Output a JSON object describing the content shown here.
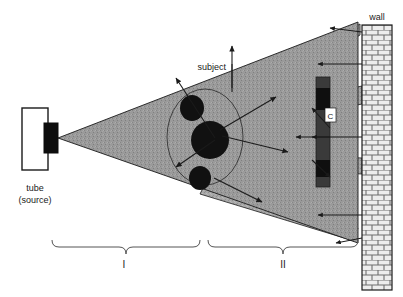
{
  "figure": {
    "title_visible": false,
    "background_color": "#ffffff"
  },
  "labels": {
    "tube_line1": "tube",
    "tube_line2": "(source)",
    "subject": "subject",
    "wall": "wall",
    "cassette": "C",
    "zone_one": "I",
    "zone_two": "II"
  },
  "colors": {
    "beam_fill": "#a8a8a8",
    "beam_stroke": "#1a1a1a",
    "subject_fill": "#9a9a9a",
    "organ_fill": "#111111",
    "tube_housing_fill": "#ffffff",
    "tube_port_fill": "#0d0d0d",
    "cassette_fill": "#3a3a3a",
    "wall_fill": "#e8e8e8",
    "wall_mortar": "#707070",
    "arrow_color": "#1a1a1a",
    "brace_color": "#555555",
    "outline": "#1a1a1a"
  },
  "components": {
    "tube": {
      "name": "x-ray-tube-housing",
      "x": 22,
      "y": 108,
      "width": 26,
      "height": 62
    },
    "tube_port": {
      "name": "x-ray-tube-port",
      "x": 44,
      "y": 123,
      "width": 14,
      "height": 30
    },
    "subject": {
      "name": "subject-body",
      "cx": 205,
      "cy": 137,
      "rx": 38,
      "ry": 48
    },
    "organs": [
      {
        "name": "organ-upper",
        "cx": 192,
        "cy": 108,
        "rx": 12,
        "ry": 13
      },
      {
        "name": "organ-center",
        "cx": 210,
        "cy": 140,
        "rx": 19,
        "ry": 19
      },
      {
        "name": "organ-lower",
        "cx": 200,
        "cy": 178,
        "rx": 11,
        "ry": 12
      }
    ],
    "cassette": {
      "name": "cassette-detector",
      "x": 316,
      "y": 77,
      "width": 14,
      "height": 110
    },
    "wall": {
      "name": "lead-wall",
      "x": 362,
      "y": 25,
      "width": 30,
      "height": 265,
      "brick_rows": 26
    },
    "beam_apex": {
      "x": 58,
      "y": 138
    }
  },
  "zones": [
    {
      "id": "zone-one",
      "label": "I",
      "x_start": 52,
      "x_end": 200,
      "brace_y": 243,
      "label_x": 124,
      "label_y": 266
    },
    {
      "id": "zone-two",
      "label": "II",
      "x_start": 208,
      "x_end": 357,
      "brace_y": 243,
      "label_x": 283,
      "label_y": 266
    }
  ],
  "annotations": {
    "subject_leader": {
      "from_x": 232,
      "from_y": 66,
      "to_x": 232,
      "to_y": 88
    },
    "scatter_arrow_count": 12
  }
}
